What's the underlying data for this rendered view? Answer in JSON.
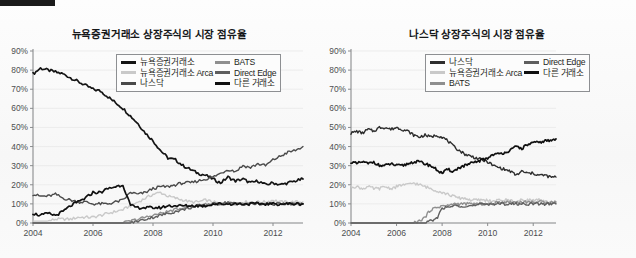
{
  "figure": {
    "background_color": "#fafafa",
    "marker_bar_color": "#1b1b1b"
  },
  "palette": {
    "nyse": "#141414",
    "nyse_arca": "#c9c9c9",
    "nasdaq": "#4a4a4a",
    "bats": "#8f8f8f",
    "direct_edge": "#5e5e5e",
    "other": "#101010",
    "axis": "#8a8c8e",
    "grid": "#e6e6e6",
    "tick_text": "#4c4e50"
  },
  "charts": [
    {
      "id": "nyse-listed",
      "title": "뉴욕증권거래소 상장주식의 시장 점유율",
      "legend": [
        {
          "label": "뉴욕증권거래소",
          "color": "#141414",
          "width": 2.6
        },
        {
          "label": "뉴욕증권거래소 Arca",
          "color": "#c9c9c9",
          "width": 2.6
        },
        {
          "label": "나스닥",
          "color": "#4a4a4a",
          "width": 2.6
        },
        {
          "label": "BATS",
          "color": "#8f8f8f",
          "width": 2.6
        },
        {
          "label": "Direct Edge",
          "color": "#5e5e5e",
          "width": 2.6
        },
        {
          "label": "다른 거래소",
          "color": "#101010",
          "width": 3.0
        }
      ],
      "y_ticks": [
        "0%",
        "10%",
        "20%",
        "30%",
        "40%",
        "50%",
        "60%",
        "70%",
        "80%",
        "90%"
      ],
      "x_ticks": [
        "2004",
        "2006",
        "2008",
        "2010",
        "2012"
      ]
    },
    {
      "id": "nasdaq-listed",
      "title": "나스닥 상장주식의 시장 점유율",
      "legend": [
        {
          "label": "나스닥",
          "color": "#2d2d2d",
          "width": 2.6
        },
        {
          "label": "뉴욕증권거래소 Arca",
          "color": "#c9c9c9",
          "width": 2.6
        },
        {
          "label": "BATS",
          "color": "#8f8f8f",
          "width": 2.6
        },
        {
          "label": "Direct Edge",
          "color": "#5e5e5e",
          "width": 2.6
        },
        {
          "label": "다른 거래소",
          "color": "#101010",
          "width": 3.0
        }
      ],
      "y_ticks": [
        "0%",
        "10%",
        "20%",
        "30%",
        "40%",
        "50%",
        "60%",
        "70%",
        "80%",
        "90%"
      ],
      "x_ticks": [
        "2004",
        "2006",
        "2008",
        "2010",
        "2012"
      ]
    }
  ],
  "chart_data": [
    {
      "type": "line",
      "title": "뉴욕증권거래소 상장주식의 시장 점유율",
      "xlabel": "",
      "ylabel": "",
      "xlim": [
        2004.0,
        2013.0
      ],
      "ylim": [
        0,
        90
      ],
      "y_unit": "%",
      "grid": true,
      "legend_position": "top-center",
      "x": [
        2004.0,
        2004.25,
        2004.5,
        2004.75,
        2005.0,
        2005.25,
        2005.5,
        2005.75,
        2006.0,
        2006.25,
        2006.5,
        2006.75,
        2007.0,
        2007.25,
        2007.5,
        2007.75,
        2008.0,
        2008.25,
        2008.5,
        2008.75,
        2009.0,
        2009.25,
        2009.5,
        2009.75,
        2010.0,
        2010.25,
        2010.5,
        2010.75,
        2011.0,
        2011.25,
        2011.5,
        2011.75,
        2012.0,
        2012.25,
        2012.5,
        2012.75,
        2013.0
      ],
      "series": [
        {
          "name": "뉴욕증권거래소",
          "color": "#141414",
          "values": [
            78,
            81,
            80,
            79,
            78,
            76,
            74,
            72,
            70,
            69,
            66,
            63,
            60,
            56,
            52,
            47,
            43,
            38,
            34,
            33,
            30,
            28,
            26,
            25,
            23,
            21,
            24,
            22,
            23,
            21,
            22,
            20,
            21,
            20,
            21,
            22,
            23
          ]
        },
        {
          "name": "뉴욕증권거래소 Arca",
          "color": "#c9c9c9",
          "values": [
            1,
            1,
            1,
            2,
            2,
            2,
            3,
            3,
            3,
            4,
            5,
            6,
            7,
            9,
            11,
            13,
            15,
            16,
            14,
            13,
            12,
            11,
            11,
            12,
            11,
            10,
            11,
            10,
            11,
            11,
            11,
            11,
            12,
            11,
            11,
            11,
            11
          ]
        },
        {
          "name": "나스닥",
          "color": "#4a4a4a",
          "values": [
            15,
            14,
            14,
            15,
            13,
            12,
            11,
            11,
            10,
            10,
            10,
            11,
            12,
            16,
            15,
            16,
            18,
            19,
            19,
            20,
            21,
            21,
            22,
            23,
            24,
            26,
            28,
            27,
            30,
            29,
            31,
            30,
            33,
            35,
            37,
            38,
            40
          ]
        },
        {
          "name": "BATS",
          "color": "#8f8f8f",
          "values": [
            0,
            0,
            0,
            0,
            0,
            0,
            0,
            0,
            0,
            0,
            0,
            0,
            0,
            1,
            2,
            3,
            4,
            5,
            6,
            7,
            8,
            9,
            9,
            10,
            10,
            10,
            10,
            10,
            10,
            10,
            10,
            10,
            10,
            10,
            10,
            10,
            10
          ]
        },
        {
          "name": "Direct Edge",
          "color": "#5e5e5e",
          "values": [
            0,
            0,
            0,
            0,
            0,
            0,
            0,
            0,
            0,
            0,
            0,
            0,
            0,
            0,
            1,
            2,
            3,
            4,
            5,
            6,
            7,
            8,
            9,
            9,
            10,
            10,
            11,
            10,
            10,
            10,
            10,
            10,
            10,
            10,
            10,
            10,
            10
          ]
        },
        {
          "name": "다른 거래소",
          "color": "#101010",
          "values": [
            5,
            4,
            5,
            4,
            6,
            9,
            11,
            13,
            16,
            16,
            18,
            19,
            20,
            9,
            8,
            8,
            8,
            8,
            9,
            9,
            9,
            9,
            9,
            9,
            10,
            10,
            10,
            10,
            10,
            10,
            10,
            10,
            10,
            10,
            10,
            10,
            10
          ]
        }
      ]
    },
    {
      "type": "line",
      "title": "나스닥 상장주식의 시장 점유율",
      "xlabel": "",
      "ylabel": "",
      "xlim": [
        2004.0,
        2013.0
      ],
      "ylim": [
        0,
        90
      ],
      "y_unit": "%",
      "grid": true,
      "legend_position": "top-center",
      "x": [
        2004.0,
        2004.25,
        2004.5,
        2004.75,
        2005.0,
        2005.25,
        2005.5,
        2005.75,
        2006.0,
        2006.25,
        2006.5,
        2006.75,
        2007.0,
        2007.25,
        2007.5,
        2007.75,
        2008.0,
        2008.25,
        2008.5,
        2008.75,
        2009.0,
        2009.25,
        2009.5,
        2009.75,
        2010.0,
        2010.25,
        2010.5,
        2010.75,
        2011.0,
        2011.25,
        2011.5,
        2011.75,
        2012.0,
        2012.25,
        2012.5,
        2012.75,
        2013.0
      ],
      "series": [
        {
          "name": "나스닥",
          "color": "#2d2d2d",
          "values": [
            47,
            48,
            47,
            49,
            48,
            50,
            50,
            49,
            50,
            49,
            48,
            46,
            45,
            46,
            45,
            46,
            45,
            43,
            40,
            38,
            36,
            35,
            34,
            33,
            32,
            30,
            29,
            28,
            27,
            25,
            27,
            26,
            26,
            25,
            25,
            24,
            24
          ]
        },
        {
          "name": "뉴욕증권거래소 Arca",
          "color": "#c9c9c9",
          "values": [
            19,
            19,
            18,
            19,
            18,
            18,
            19,
            18,
            19,
            20,
            20,
            21,
            20,
            19,
            18,
            17,
            16,
            15,
            14,
            13,
            13,
            12,
            12,
            12,
            12,
            11,
            12,
            12,
            12,
            11,
            12,
            12,
            12,
            12,
            11,
            11,
            11
          ]
        },
        {
          "name": "BATS",
          "color": "#8f8f8f",
          "values": [
            0,
            0,
            0,
            0,
            0,
            0,
            0,
            0,
            0,
            0,
            0,
            0,
            1,
            3,
            7,
            8,
            9,
            9,
            10,
            10,
            10,
            10,
            10,
            10,
            10,
            10,
            11,
            11,
            11,
            11,
            11,
            11,
            11,
            11,
            11,
            11,
            11
          ]
        },
        {
          "name": "Direct Edge",
          "color": "#5e5e5e",
          "values": [
            0,
            0,
            0,
            0,
            0,
            0,
            0,
            0,
            0,
            0,
            0,
            0,
            0,
            0,
            1,
            2,
            8,
            8,
            9,
            9,
            9,
            9,
            9,
            10,
            10,
            10,
            10,
            10,
            10,
            10,
            10,
            10,
            10,
            10,
            10,
            10,
            10
          ]
        },
        {
          "name": "다른 거래소",
          "color": "#101010",
          "values": [
            32,
            31,
            32,
            31,
            32,
            30,
            30,
            31,
            30,
            30,
            31,
            32,
            32,
            31,
            30,
            28,
            26,
            28,
            27,
            29,
            30,
            31,
            32,
            33,
            34,
            36,
            36,
            37,
            38,
            40,
            39,
            41,
            42,
            42,
            43,
            43,
            44
          ]
        }
      ]
    }
  ]
}
